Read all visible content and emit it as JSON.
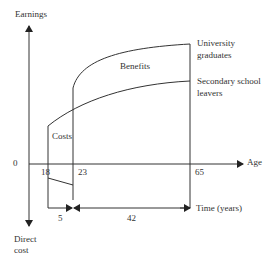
{
  "diagram": {
    "type": "age-earnings profile",
    "y_axis": {
      "top_label": "Earnings",
      "bottom_label_line1": "Direct",
      "bottom_label_line2": "cost",
      "origin_label": "0"
    },
    "x_axis": {
      "label": "Age",
      "ticks": [
        "18",
        "23",
        "65"
      ]
    },
    "curves": [
      {
        "name": "University graduates",
        "line1": "University",
        "line2": "graduates",
        "start_age": 23,
        "end_age": 65
      },
      {
        "name": "Secondary school leavers",
        "line1": "Secondary school",
        "line2": "leavers",
        "start_age": 18,
        "end_age": 65
      }
    ],
    "regions": {
      "benefits": "Benefits",
      "costs": "Costs"
    },
    "time_axis": {
      "label": "Time (years)",
      "segments": [
        "5",
        "42"
      ]
    }
  }
}
